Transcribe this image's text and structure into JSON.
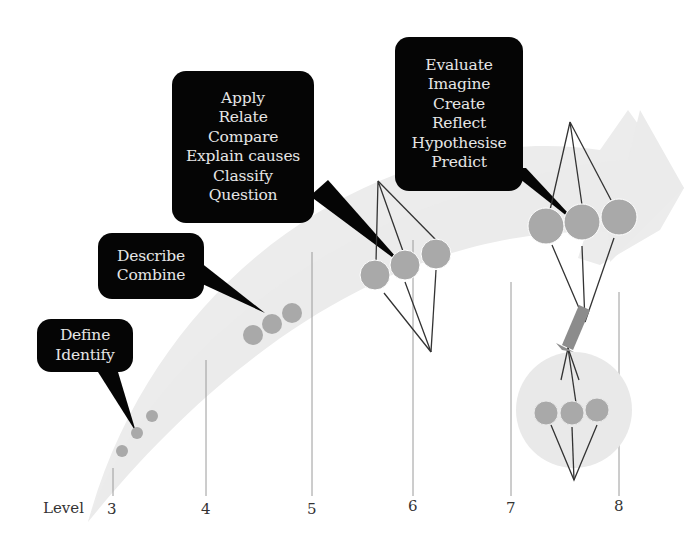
{
  "diagram": {
    "axis_label": "Level",
    "levels": [
      "3",
      "4",
      "5",
      "6",
      "7",
      "8"
    ],
    "bubbles": [
      {
        "level": "3",
        "lines": [
          "Define",
          "Identify"
        ]
      },
      {
        "level": "4",
        "lines": [
          "Describe",
          "Combine"
        ]
      },
      {
        "level": "5-6",
        "lines": [
          "Apply",
          "Relate",
          "Compare",
          "Explain causes",
          "Classify",
          "Question"
        ]
      },
      {
        "level": "7-8",
        "lines": [
          "Evaluate",
          "Imagine",
          "Create",
          "Reflect",
          "Hypothesise",
          "Predict"
        ]
      }
    ],
    "colors": {
      "arrow": "#ececec",
      "node": "#a9a9a9",
      "bubble_bg": "#050505",
      "bubble_text": "#e6e6e6",
      "connector": "#333333",
      "gridline": "#9a9a9a",
      "transfer_arrow": "#8c8c8c"
    }
  }
}
